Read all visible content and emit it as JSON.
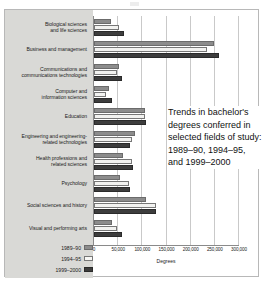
{
  "caption": "Trends in bachelor's degrees conferred in selected fields of study: 1989–90, 1994–95, and 1999–2000",
  "axis": {
    "x_title": "Degrees",
    "ticks": [
      "0",
      "50,000",
      "100,000",
      "150,000",
      "200,000",
      "250,000",
      "300,000"
    ]
  },
  "legend": {
    "items": [
      {
        "label": "1989–90",
        "color": "#8c8c8c"
      },
      {
        "label": "1994–95",
        "color": "#f7f7f5"
      },
      {
        "label": "1999–2000",
        "color": "#3d3d3d"
      }
    ]
  },
  "categories": [
    {
      "line1": "Biological sciences",
      "line2": "and life sciences"
    },
    {
      "line1": "Business and management",
      "line2": ""
    },
    {
      "line1": "Communications and",
      "line2": "communications technologies"
    },
    {
      "line1": "Computer and",
      "line2": "information sciences"
    },
    {
      "line1": "Education",
      "line2": ""
    },
    {
      "line1": "Engineering and engineering-",
      "line2": "related technologies"
    },
    {
      "line1": "Health professions and",
      "line2": "related sciences"
    },
    {
      "line1": "Psychology",
      "line2": ""
    },
    {
      "line1": "Social sciences and history",
      "line2": ""
    },
    {
      "line1": "Visual and performing arts",
      "line2": ""
    }
  ],
  "chart_data": {
    "type": "bar",
    "orientation": "horizontal",
    "title": "Trends in bachelor's degrees conferred in selected fields of study: 1989–90, 1994–95, and 1999–2000",
    "xlabel": "Degrees",
    "ylabel": "",
    "xlim": [
      0,
      300000
    ],
    "xticks": [
      0,
      50000,
      100000,
      150000,
      200000,
      250000,
      300000
    ],
    "grid": true,
    "legend_position": "bottom-left",
    "categories": [
      "Biological sciences and life sciences",
      "Business and management",
      "Communications and communications technologies",
      "Computer and information sciences",
      "Education",
      "Engineering and engineering-related technologies",
      "Health professions and related sciences",
      "Psychology",
      "Social sciences and history",
      "Visual and performing arts"
    ],
    "series": [
      {
        "name": "1989–90",
        "color": "#8c8c8c",
        "values": [
          36000,
          249000,
          51000,
          30000,
          105000,
          85000,
          59000,
          54000,
          108000,
          37000
        ]
      },
      {
        "name": "1994–95",
        "color": "#f7f7f5",
        "values": [
          51000,
          234000,
          48000,
          24000,
          106000,
          78000,
          79000,
          72000,
          128000,
          47000
        ]
      },
      {
        "name": "1999–2000",
        "color": "#3d3d3d",
        "values": [
          63000,
          258000,
          58000,
          37000,
          108000,
          74000,
          80000,
          74000,
          128000,
          58000
        ]
      }
    ]
  }
}
